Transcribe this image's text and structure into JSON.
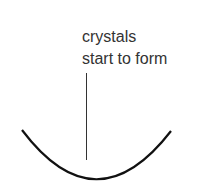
{
  "diagram": {
    "label_lines": [
      "crystals",
      "start to form"
    ],
    "colors": {
      "line": "#111111",
      "text": "#333333",
      "solution": "#bdbdbd",
      "crystal": "#ffffff"
    }
  }
}
